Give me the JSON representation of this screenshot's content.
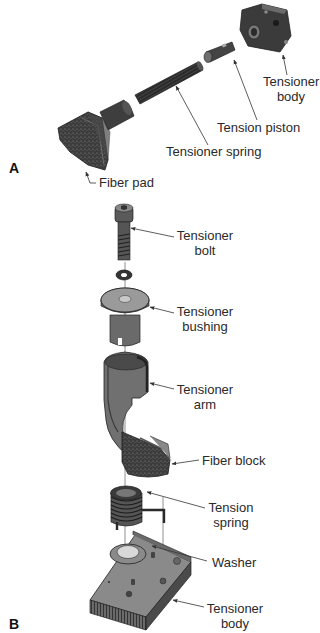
{
  "figure": {
    "panels": [
      {
        "id": "A",
        "letter": "A",
        "labels": {
          "tensioner_body_1": "Tensioner",
          "tensioner_body_2": "body",
          "tension_piston": "Tension piston",
          "tensioner_spring": "Tensioner spring",
          "fiber_pad": "Fiber pad"
        }
      },
      {
        "id": "B",
        "letter": "B",
        "labels": {
          "tensioner_bolt_1": "Tensioner",
          "tensioner_bolt_2": "bolt",
          "tensioner_bushing_1": "Tensioner",
          "tensioner_bushing_2": "bushing",
          "tensioner_arm_1": "Tensioner",
          "tensioner_arm_2": "arm",
          "fiber_block": "Fiber block",
          "tension_spring_1": "Tension",
          "tension_spring_2": "spring",
          "washer": "Washer",
          "tensioner_body_1": "Tensioner",
          "tensioner_body_2": "body"
        }
      }
    ],
    "colors": {
      "part_dark": "#3a3a3a",
      "part_mid": "#6e6e6e",
      "part_light": "#a8a8a8",
      "leader": "#333333",
      "background": "#ffffff"
    }
  }
}
